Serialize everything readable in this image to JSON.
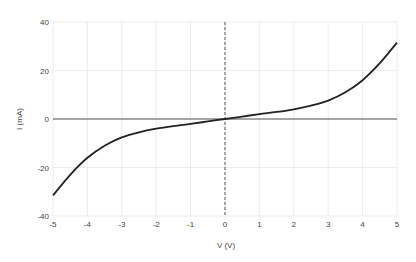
{
  "chart_data": {
    "type": "line",
    "title": "",
    "xlabel": "V (V)",
    "ylabel": "I (mA)",
    "xlim": [
      -5,
      5
    ],
    "ylim": [
      -40,
      40
    ],
    "xticks": [
      "-5",
      "-4",
      "-3",
      "-2",
      "-1",
      "0",
      "1",
      "2",
      "3",
      "4",
      "5"
    ],
    "yticks": [
      "40",
      "20",
      "0",
      "-20",
      "-40"
    ],
    "grid": true,
    "legend": null,
    "series": [
      {
        "name": "I-V curve",
        "color": "#222222",
        "x": [
          -5,
          -4.5,
          -4,
          -3.5,
          -3,
          -2.5,
          -2,
          -1.5,
          -1,
          -0.5,
          0,
          0.5,
          1,
          1.5,
          2,
          2.5,
          3,
          3.5,
          4,
          4.5,
          5
        ],
        "y": [
          -31.5,
          -23,
          -16,
          -11,
          -7.6,
          -5.5,
          -4,
          -2.9,
          -2,
          -1,
          0,
          1,
          2,
          2.9,
          4,
          5.5,
          7.6,
          11,
          16,
          23,
          31.5
        ]
      }
    ]
  }
}
